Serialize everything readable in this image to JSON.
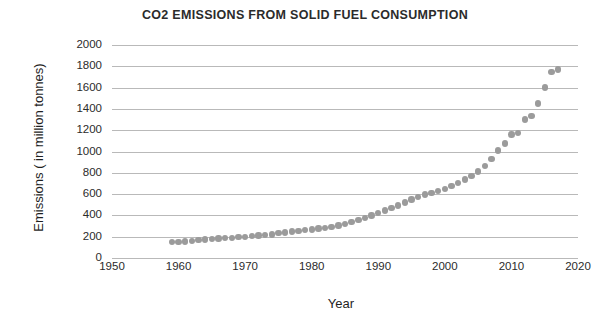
{
  "chart_data": {
    "type": "scatter",
    "title": "CO2 EMISSIONS FROM SOLID FUEL CONSUMPTION",
    "xlabel": "Year",
    "ylabel": "Emissions ( in million tonnes)",
    "xlim": [
      1950,
      2020
    ],
    "ylim": [
      0,
      2000
    ],
    "xticks": [
      1950,
      1960,
      1970,
      1980,
      1990,
      2000,
      2010,
      2020
    ],
    "yticks": [
      0,
      200,
      400,
      600,
      800,
      1000,
      1200,
      1400,
      1600,
      1800,
      2000
    ],
    "grid": "horizontal",
    "legend": "none",
    "marker_color": "#9b9b9b",
    "series": [
      {
        "name": "CO2 emissions from solid fuel consumption",
        "x": [
          1959,
          1960,
          1961,
          1962,
          1963,
          1964,
          1965,
          1966,
          1967,
          1968,
          1969,
          1970,
          1971,
          1972,
          1973,
          1974,
          1975,
          1976,
          1977,
          1978,
          1979,
          1980,
          1981,
          1982,
          1983,
          1984,
          1985,
          1986,
          1987,
          1988,
          1989,
          1990,
          1991,
          1992,
          1993,
          1994,
          1995,
          1996,
          1997,
          1998,
          1999,
          2000,
          2001,
          2002,
          2003,
          2004,
          2005,
          2006,
          2007,
          2008,
          2009,
          2010,
          2011,
          2012,
          2013,
          2014,
          2015,
          2016,
          2017
        ],
        "y": [
          152,
          150,
          156,
          162,
          168,
          172,
          178,
          182,
          186,
          190,
          196,
          200,
          205,
          210,
          218,
          222,
          232,
          240,
          248,
          254,
          262,
          268,
          276,
          282,
          292,
          305,
          320,
          338,
          356,
          378,
          398,
          420,
          445,
          470,
          492,
          520,
          548,
          572,
          596,
          610,
          628,
          648,
          676,
          704,
          736,
          772,
          812,
          862,
          930,
          1010,
          1075,
          1160,
          1175,
          1300,
          1335,
          1450,
          1600,
          1745,
          1770
        ]
      }
    ]
  }
}
